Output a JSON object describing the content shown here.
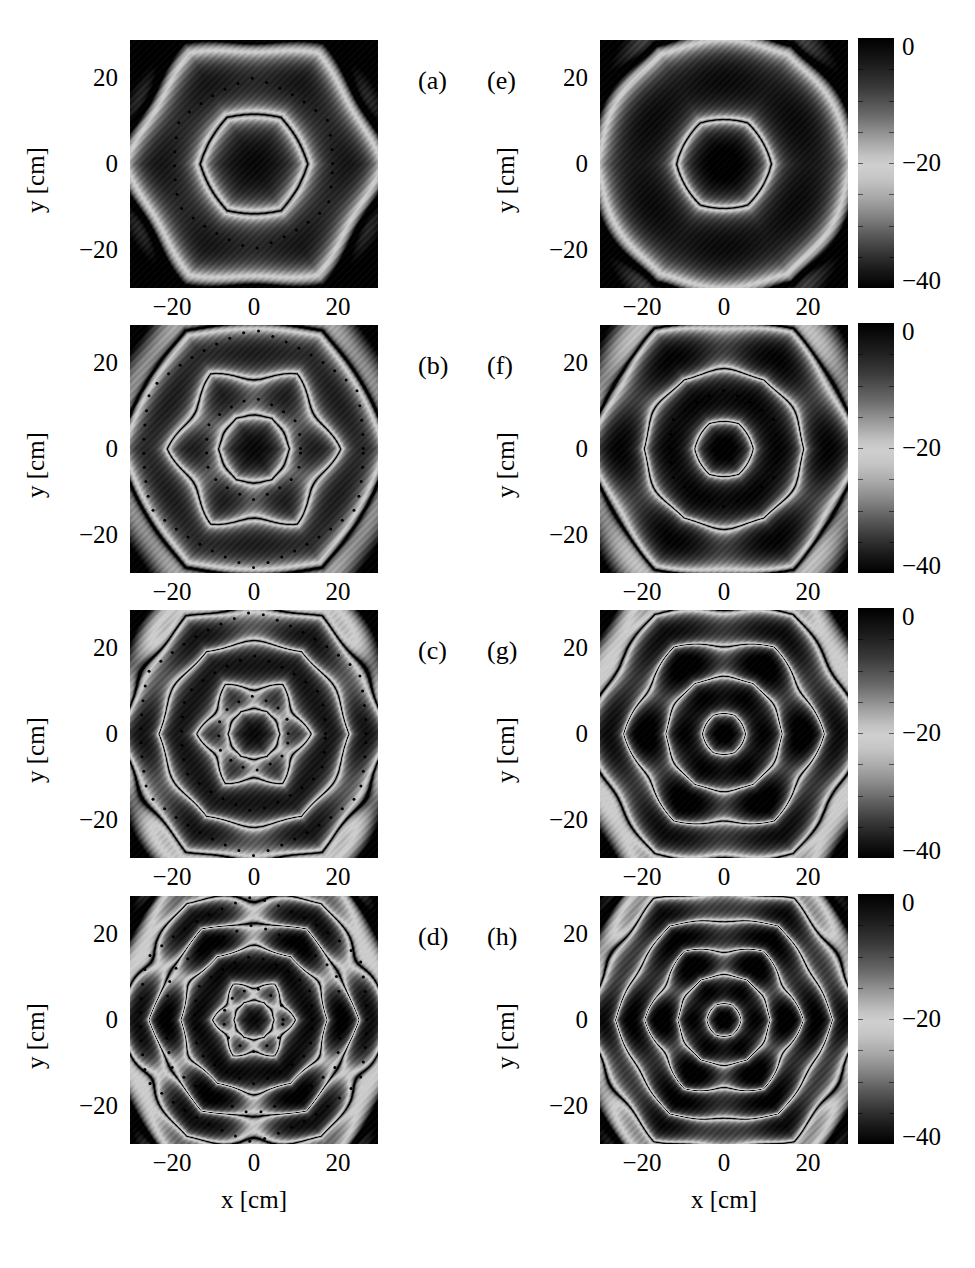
{
  "figure": {
    "type": "multi-panel-grayscale-intensity-maps",
    "rows": 4,
    "cols": 2,
    "axis": {
      "x_title": "x [cm]",
      "y_title": "y [cm]",
      "x_ticks": [
        "−20",
        "0",
        "20"
      ],
      "y_ticks": [
        "20",
        "0",
        "−20"
      ],
      "x_range": [
        -30,
        30
      ],
      "y_range": [
        -30,
        30
      ],
      "units": "cm"
    },
    "colorbar": {
      "ticks": [
        "0",
        "−20",
        "−40"
      ],
      "range": [
        -40,
        0
      ],
      "units": "dB",
      "colormap": "grayscale-cyclic-dark-light-dark"
    },
    "panels": [
      {
        "id": "a",
        "label": "(a)",
        "column": "left",
        "row": 1,
        "has_colorbar": false,
        "rings": 1,
        "description": "single broad dark hexagonal core with bright surrounding halo and dotted contour hexagon"
      },
      {
        "id": "b",
        "label": "(b)",
        "column": "left",
        "row": 2,
        "has_colorbar": false,
        "rings": 2,
        "description": "dark core with two bright hexagonal rings"
      },
      {
        "id": "c",
        "label": "(c)",
        "column": "left",
        "row": 3,
        "has_colorbar": false,
        "rings": 3,
        "description": "dark core with three bright rings and six lobed petals"
      },
      {
        "id": "d",
        "label": "(d)",
        "column": "left",
        "row": 4,
        "has_colorbar": false,
        "rings": 4,
        "description": "dark core with four bright rings and twelve lobes"
      },
      {
        "id": "e",
        "label": "(e)",
        "column": "right",
        "row": 1,
        "has_colorbar": true,
        "rings": 1,
        "description": "bright central point, dark hexagonal field, single outer bright hexagon ring"
      },
      {
        "id": "f",
        "label": "(f)",
        "column": "right",
        "row": 2,
        "has_colorbar": true,
        "rings": 2,
        "description": "bright central point with two bright hexagonal rings"
      },
      {
        "id": "g",
        "label": "(g)",
        "column": "right",
        "row": 3,
        "has_colorbar": true,
        "rings": 3,
        "description": "bright central point with three rings and six petal lobes"
      },
      {
        "id": "h",
        "label": "(h)",
        "column": "right",
        "row": 4,
        "has_colorbar": true,
        "rings": 4,
        "description": "bright central point with four rings and many lobes"
      }
    ]
  },
  "chart_data": {
    "type": "heatmap",
    "title": "",
    "xlabel": "x [cm]",
    "ylabel": "y [cm]",
    "xlim": [
      -30,
      30
    ],
    "ylim": [
      -30,
      30
    ],
    "xtick_values": [
      -20,
      0,
      20
    ],
    "ytick_values": [
      -20,
      0,
      20
    ],
    "xtick_labels": [
      "−20",
      "0",
      "20"
    ],
    "ytick_labels": [
      "−20",
      "0",
      "20"
    ],
    "grid": false,
    "legend_position": "right-colorbar",
    "colorbar": {
      "tick_values": [
        0,
        -20,
        -40
      ],
      "tick_labels": [
        "0",
        "−20",
        "−40"
      ],
      "vmin": -40,
      "vmax": 0,
      "units": "dB"
    },
    "panels": [
      {
        "label": "(a)",
        "mode_order": 1,
        "hex_radius_cm": 20,
        "core": "dark",
        "n_bright_rings": 1,
        "symmetry": 6
      },
      {
        "label": "(b)",
        "mode_order": 2,
        "hex_radius_cm": 24,
        "core": "dark",
        "n_bright_rings": 2,
        "symmetry": 6
      },
      {
        "label": "(c)",
        "mode_order": 3,
        "hex_radius_cm": 26,
        "core": "dark",
        "n_bright_rings": 3,
        "symmetry": 6
      },
      {
        "label": "(d)",
        "mode_order": 4,
        "hex_radius_cm": 28,
        "core": "dark",
        "n_bright_rings": 4,
        "symmetry": 6
      },
      {
        "label": "(e)",
        "mode_order": 1,
        "hex_radius_cm": 26,
        "core": "bright-point",
        "n_bright_rings": 1,
        "symmetry": 6
      },
      {
        "label": "(f)",
        "mode_order": 2,
        "hex_radius_cm": 27,
        "core": "bright-point",
        "n_bright_rings": 2,
        "symmetry": 6
      },
      {
        "label": "(g)",
        "mode_order": 3,
        "hex_radius_cm": 27,
        "core": "bright-point",
        "n_bright_rings": 3,
        "symmetry": 6
      },
      {
        "label": "(h)",
        "mode_order": 4,
        "hex_radius_cm": 28,
        "core": "bright-point",
        "n_bright_rings": 4,
        "symmetry": 6
      }
    ]
  }
}
